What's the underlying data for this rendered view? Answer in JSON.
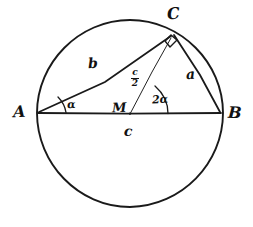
{
  "diagram": {
    "background_color": "#ffffff",
    "stroke_color": "#111111",
    "circle": {
      "center_x": 130,
      "center_y": 114,
      "radius": 93
    },
    "points": {
      "A": {
        "x": 38,
        "y": 113,
        "label": "A"
      },
      "B": {
        "x": 221,
        "y": 113,
        "label": "B"
      },
      "C": {
        "x": 172,
        "y": 33,
        "label": "C"
      },
      "M": {
        "x": 130,
        "y": 114,
        "label": "M"
      }
    },
    "segments": [
      {
        "name": "diameter-AB",
        "from": "A",
        "to": "B",
        "label": "c"
      },
      {
        "name": "side-AC",
        "from": "A",
        "to": "C",
        "label": "b"
      },
      {
        "name": "side-CB",
        "from": "C",
        "to": "B",
        "label": "a"
      },
      {
        "name": "radius-MC",
        "from": "M",
        "to": "C",
        "label": "c/2"
      }
    ],
    "labels": {
      "vertex_a": "A",
      "vertex_b": "B",
      "vertex_c": "C",
      "center": "M",
      "side_a": "a",
      "side_b": "b",
      "side_c": "c",
      "radius_numerator": "c",
      "radius_denominator": "2",
      "angle_at_a": "α",
      "angle_at_m": "2α"
    },
    "markers": {
      "right_angle_at_c": "right-angle-square",
      "angle_arc_a": "alpha-arc",
      "angle_arc_m": "two-alpha-arc"
    }
  }
}
